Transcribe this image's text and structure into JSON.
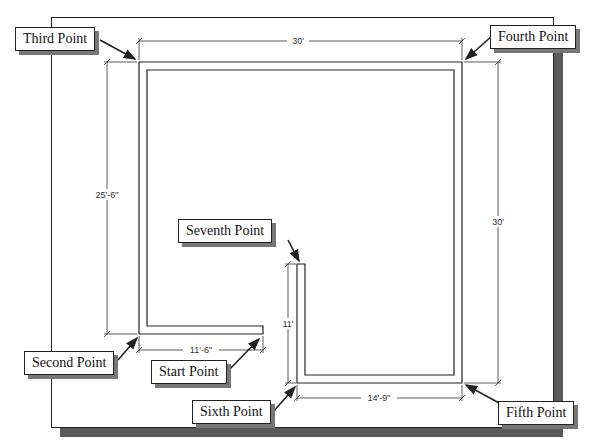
{
  "callouts": {
    "third": "Third Point",
    "fourth": "Fourth Point",
    "seventh": "Seventh Point",
    "second": "Second Point",
    "start": "Start Point",
    "sixth": "Sixth Point",
    "fifth": "Fifth Point"
  },
  "dimensions": {
    "top_width": "30'",
    "left_height": "25'-6\"",
    "right_height": "30'",
    "bottom_left_width": "11'-6\"",
    "inner_vertical": "11'",
    "bottom_right_width": "14'-9\""
  },
  "colors": {
    "line": "#222222",
    "shadow": "#5a5a5a",
    "background": "#ffffff"
  }
}
